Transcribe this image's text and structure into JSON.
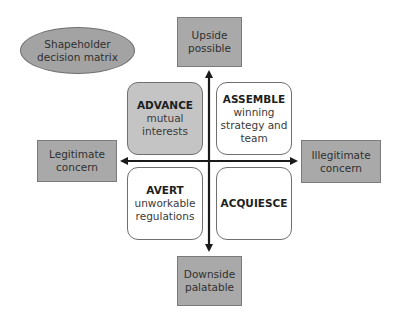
{
  "diagram": {
    "title": {
      "lines": [
        "Shapeholder",
        "decision matrix"
      ]
    },
    "axes": {
      "top": {
        "lines": [
          "Upside",
          "possible"
        ]
      },
      "bottom": {
        "lines": [
          "Downside",
          "palatable"
        ]
      },
      "left": {
        "lines": [
          "Legitimate",
          "concern"
        ]
      },
      "right": {
        "lines": [
          "Illegitimate",
          "concern"
        ]
      }
    },
    "quadrants": [
      {
        "position": "top-left",
        "title": "ADVANCE",
        "lines": [
          "mutual",
          "interests"
        ],
        "shaded": true
      },
      {
        "position": "top-right",
        "title": "ASSEMBLE",
        "lines": [
          "winning",
          "strategy and",
          "team"
        ],
        "shaded": false
      },
      {
        "position": "bottom-left",
        "title": "AVERT",
        "lines": [
          "unworkable",
          "regulations"
        ],
        "shaded": false
      },
      {
        "position": "bottom-right",
        "title": "ACQUIESCE",
        "lines": [],
        "shaded": false
      }
    ],
    "colors": {
      "label_box_fill": "#a9a9a9",
      "ellipse_fill": "#a3a3a3",
      "shaded_quadrant_fill": "#c4c4c4",
      "arrow": "#1a1a1a"
    }
  }
}
